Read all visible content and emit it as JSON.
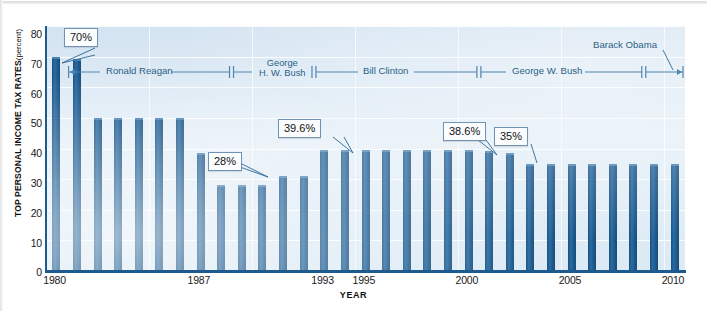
{
  "chart_data": {
    "type": "bar",
    "title": "",
    "xlabel": "YEAR",
    "ylabel": "TOP PERSONAL INCOME TAX RATES",
    "ylabel_unit": "(percent)",
    "ylim": [
      0,
      80
    ],
    "ytick_labels": [
      "0",
      "10",
      "20",
      "30",
      "40",
      "50",
      "60",
      "70",
      "80"
    ],
    "ytick_values": [
      0,
      10,
      20,
      30,
      40,
      50,
      60,
      70,
      80
    ],
    "xtick_labels": [
      "1980",
      "1987",
      "1993",
      "1995",
      "2000",
      "2005",
      "2010"
    ],
    "xtick_values": [
      1980,
      1987,
      1993,
      1995,
      2000,
      2005,
      2010
    ],
    "grid": true,
    "legend": "none",
    "categories": [
      1980,
      1981,
      1982,
      1983,
      1984,
      1985,
      1986,
      1987,
      1988,
      1989,
      1990,
      1991,
      1992,
      1993,
      1994,
      1995,
      1996,
      1997,
      1998,
      1999,
      2000,
      2001,
      2002,
      2003,
      2004,
      2005,
      2006,
      2007,
      2008,
      2009,
      2010
    ],
    "values": [
      70,
      69.125,
      50,
      50,
      50,
      50,
      50,
      38.5,
      28,
      28,
      28,
      31,
      31,
      39.6,
      39.6,
      39.6,
      39.6,
      39.6,
      39.6,
      39.6,
      39.6,
      39.1,
      38.6,
      35,
      35,
      35,
      35,
      35,
      35,
      35,
      35
    ],
    "bar_color": "#1d5a8e",
    "plot_background": "#dfeaf4",
    "annotations": [
      {
        "label": "70%",
        "target_year": 1980
      },
      {
        "label": "28%",
        "target_year": 1988
      },
      {
        "label": "39.6%",
        "target_year": 1993
      },
      {
        "label": "38.6%",
        "target_year": 2002
      },
      {
        "label": "35%",
        "target_year": 2003
      }
    ],
    "president_spans": [
      {
        "name": "Ronald Reagan",
        "start_year": 1981,
        "end_year": 1989
      },
      {
        "name": "George\nH. W. Bush",
        "start_year": 1989,
        "end_year": 1993
      },
      {
        "name": "Bill Clinton",
        "start_year": 1993,
        "end_year": 2001
      },
      {
        "name": "George W. Bush",
        "start_year": 2001,
        "end_year": 2009
      },
      {
        "name": "Barack Obama",
        "start_year": 2009,
        "end_year": 2011
      }
    ]
  },
  "axis": {
    "y_title_main": "TOP PERSONAL INCOME TAX RATES",
    "y_title_unit": "(percent)",
    "x_title": "YEAR"
  },
  "callouts": {
    "c70": "70%",
    "c28": "28%",
    "c396": "39.6%",
    "c386": "38.6%",
    "c35": "35%"
  },
  "presidents": {
    "reagan": "Ronald Reagan",
    "hwbush_line1": "George",
    "hwbush_line2": "H. W. Bush",
    "clinton": "Bill Clinton",
    "wbush": "George W. Bush",
    "obama": "Barack Obama"
  },
  "yticks": {
    "t0": "0",
    "t10": "10",
    "t20": "20",
    "t30": "30",
    "t40": "40",
    "t50": "50",
    "t60": "60",
    "t70": "70",
    "t80": "80"
  },
  "xticks": {
    "x1980": "1980",
    "x1987": "1987",
    "x1993": "1993",
    "x1995": "1995",
    "x2000": "2000",
    "x2005": "2005",
    "x2010": "2010"
  }
}
